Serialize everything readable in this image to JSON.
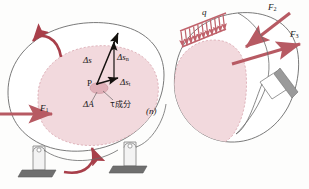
{
  "figure": {
    "type": "engineering-mechanics-diagram",
    "colors": {
      "body_fill": "#f2d9dd",
      "body_stroke": "#6b6b6b",
      "dashed_region": "#e9c4cb",
      "force_arrow": "#b75a63",
      "moment_arrow": "#a83f4a",
      "load_hatch": "#c0636c",
      "vector_black": "#15120f",
      "support_gray": "#8d8d8d",
      "ground_dark": "#5d5d5d"
    }
  },
  "left_body": {
    "point_label": "P",
    "vectors": [
      {
        "name": "delta-s",
        "label": "Δs",
        "sub": ""
      },
      {
        "name": "delta-s-n",
        "label": "Δs",
        "sub": "n"
      },
      {
        "name": "delta-s-t",
        "label": "Δs",
        "sub": "t"
      }
    ],
    "area_label": "ΔA",
    "tau_label": "τ成分",
    "section_label": "(n)",
    "force_label": "F",
    "force_sub": "1",
    "moment_arrows": [
      {
        "name": "moment-arrow-top-left",
        "direction": "counterclockwise"
      },
      {
        "name": "moment-arrow-bottom",
        "direction": "counterclockwise"
      }
    ]
  },
  "right_body": {
    "distributed_load_label": "q",
    "forces": [
      {
        "name": "force-f2",
        "label": "F",
        "sub": "2"
      },
      {
        "name": "force-f3",
        "label": "F",
        "sub": "3"
      }
    ]
  },
  "supports": [
    {
      "name": "support-pin-left",
      "kind": "pin-roller"
    },
    {
      "name": "support-pin-right",
      "kind": "pin-roller"
    },
    {
      "name": "support-diagonal",
      "kind": "pin-inclined"
    }
  ]
}
